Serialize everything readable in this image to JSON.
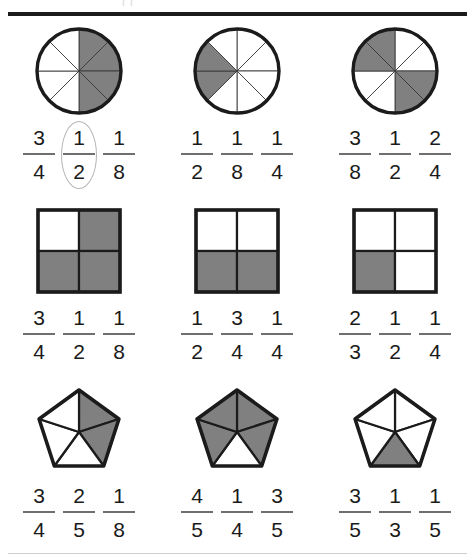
{
  "page": {
    "ghost_header_text": "|                                                     |",
    "shaded_color": "#808080",
    "outline_color": "#1b1b1b",
    "background_color": "#ffffff",
    "highlight_color": "#b4b4b4"
  },
  "rows": [
    {
      "shape_type": "circle",
      "shapes": [
        {
          "name": "circle-eighths-half-shaded",
          "parts": 8,
          "shaded": [
            0,
            1,
            2,
            3
          ],
          "fraction": "1/2"
        },
        {
          "name": "circle-eighths-quarter-shaded",
          "parts": 8,
          "shaded": [
            5,
            6
          ],
          "fraction": "1/4"
        },
        {
          "name": "circle-eighths-alternating-shaded",
          "parts": 8,
          "shaded": [
            2,
            3,
            6,
            7
          ],
          "fraction": "1/2"
        }
      ],
      "fraction_groups": [
        {
          "fractions": [
            {
              "numerator": "3",
              "denominator": "4"
            },
            {
              "numerator": "1",
              "denominator": "2"
            },
            {
              "numerator": "1",
              "denominator": "8"
            }
          ],
          "highlighted_index": 1
        },
        {
          "fractions": [
            {
              "numerator": "1",
              "denominator": "2"
            },
            {
              "numerator": "1",
              "denominator": "8"
            },
            {
              "numerator": "1",
              "denominator": "4"
            }
          ],
          "highlighted_index": -1
        },
        {
          "fractions": [
            {
              "numerator": "3",
              "denominator": "8"
            },
            {
              "numerator": "1",
              "denominator": "2"
            },
            {
              "numerator": "2",
              "denominator": "4"
            }
          ],
          "highlighted_index": -1
        }
      ]
    },
    {
      "shape_type": "square",
      "shapes": [
        {
          "name": "square-quarters-three-shaded",
          "parts": 4,
          "shaded": [
            1,
            2,
            3
          ],
          "fraction": "3/4"
        },
        {
          "name": "square-quarters-bottom-half-shaded",
          "parts": 4,
          "shaded": [
            2,
            3
          ],
          "fraction": "1/2"
        },
        {
          "name": "square-quarters-one-shaded",
          "parts": 4,
          "shaded": [
            2
          ],
          "fraction": "1/4"
        }
      ],
      "fraction_groups": [
        {
          "fractions": [
            {
              "numerator": "3",
              "denominator": "4"
            },
            {
              "numerator": "1",
              "denominator": "2"
            },
            {
              "numerator": "1",
              "denominator": "8"
            }
          ],
          "highlighted_index": -1
        },
        {
          "fractions": [
            {
              "numerator": "1",
              "denominator": "2"
            },
            {
              "numerator": "3",
              "denominator": "4"
            },
            {
              "numerator": "1",
              "denominator": "4"
            }
          ],
          "highlighted_index": -1
        },
        {
          "fractions": [
            {
              "numerator": "2",
              "denominator": "3"
            },
            {
              "numerator": "1",
              "denominator": "2"
            },
            {
              "numerator": "1",
              "denominator": "4"
            }
          ],
          "highlighted_index": -1
        }
      ]
    },
    {
      "shape_type": "pentagon",
      "shapes": [
        {
          "name": "pentagon-fifths-two-shaded",
          "parts": 5,
          "shaded": [
            0,
            1
          ],
          "fraction": "2/5"
        },
        {
          "name": "pentagon-fifths-four-shaded",
          "parts": 5,
          "shaded": [
            0,
            1,
            3,
            4
          ],
          "fraction": "4/5"
        },
        {
          "name": "pentagon-fifths-one-shaded",
          "parts": 5,
          "shaded": [
            2
          ],
          "fraction": "1/5"
        }
      ],
      "fraction_groups": [
        {
          "fractions": [
            {
              "numerator": "3",
              "denominator": "4"
            },
            {
              "numerator": "2",
              "denominator": "5"
            },
            {
              "numerator": "1",
              "denominator": "8"
            }
          ],
          "highlighted_index": -1
        },
        {
          "fractions": [
            {
              "numerator": "4",
              "denominator": "5"
            },
            {
              "numerator": "1",
              "denominator": "4"
            },
            {
              "numerator": "3",
              "denominator": "5"
            }
          ],
          "highlighted_index": -1
        },
        {
          "fractions": [
            {
              "numerator": "3",
              "denominator": "5"
            },
            {
              "numerator": "1",
              "denominator": "3"
            },
            {
              "numerator": "1",
              "denominator": "5"
            }
          ],
          "highlighted_index": -1
        }
      ]
    }
  ]
}
